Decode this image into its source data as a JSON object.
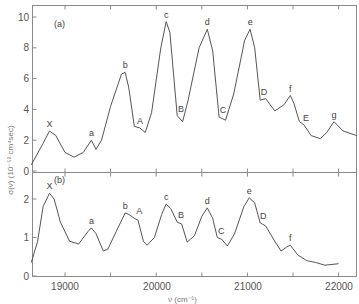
{
  "chart_data": [
    {
      "type": "line",
      "panel_label": "(a)",
      "xlabel": "ν (cm⁻¹)",
      "ylabel": "σ(ν) (10⁻⁵² cm⁴sec)",
      "xlim": [
        18630,
        22250
      ],
      "ylim": [
        0,
        11
      ],
      "yticks": [
        0,
        2,
        4,
        6,
        8,
        10
      ],
      "x": [
        18630,
        18760,
        18830,
        18900,
        19000,
        19100,
        19200,
        19290,
        19340,
        19400,
        19500,
        19620,
        19660,
        19700,
        19760,
        19820,
        19880,
        19950,
        20050,
        20110,
        20150,
        20230,
        20290,
        20350,
        20470,
        20560,
        20620,
        20690,
        20760,
        20850,
        20970,
        21030,
        21080,
        21140,
        21200,
        21300,
        21400,
        21470,
        21510,
        21570,
        21620,
        21700,
        21800,
        21870,
        21950,
        22050,
        22200
      ],
      "y": [
        0.4,
        1.8,
        2.6,
        2.3,
        1.2,
        0.9,
        1.2,
        2.0,
        1.4,
        2.0,
        4.2,
        6.3,
        6.4,
        5.4,
        2.9,
        2.8,
        2.5,
        3.8,
        8.0,
        9.7,
        9.0,
        3.6,
        3.2,
        4.6,
        8.0,
        9.2,
        7.8,
        3.5,
        3.3,
        5.0,
        8.5,
        9.2,
        8.0,
        4.6,
        4.7,
        3.9,
        4.3,
        4.9,
        4.4,
        3.2,
        3.0,
        2.3,
        2.1,
        2.5,
        3.2,
        2.6,
        2.3
      ],
      "peak_labels": [
        {
          "text": "X",
          "x": 18830,
          "y": 2.6
        },
        {
          "text": "a",
          "x": 19290,
          "y": 2.0
        },
        {
          "text": "b",
          "x": 19660,
          "y": 6.4
        },
        {
          "text": "A",
          "x": 19790,
          "y": 2.8
        },
        {
          "text": "c",
          "x": 20110,
          "y": 9.7
        },
        {
          "text": "B",
          "x": 20240,
          "y": 3.6
        },
        {
          "text": "d",
          "x": 20560,
          "y": 9.2
        },
        {
          "text": "C",
          "x": 20700,
          "y": 3.5
        },
        {
          "text": "e",
          "x": 21030,
          "y": 9.2
        },
        {
          "text": "D",
          "x": 21150,
          "y": 4.7
        },
        {
          "text": "f",
          "x": 21470,
          "y": 4.9
        },
        {
          "text": "E",
          "x": 21610,
          "y": 3.0
        },
        {
          "text": "g",
          "x": 21950,
          "y": 3.2
        }
      ]
    },
    {
      "type": "line",
      "panel_label": "(b)",
      "xlabel": "ν (cm⁻¹)",
      "ylabel": "σ(ν) (10⁻⁵² cm⁴sec)",
      "xlim": [
        18630,
        22250
      ],
      "ylim": [
        0,
        2.5
      ],
      "yticks": [
        0,
        1,
        2
      ],
      "xticks": [
        19000,
        20000,
        21000,
        22000
      ],
      "x": [
        18630,
        18700,
        18760,
        18830,
        18880,
        18950,
        19050,
        19150,
        19250,
        19290,
        19340,
        19420,
        19470,
        19560,
        19660,
        19700,
        19760,
        19800,
        19860,
        19900,
        19980,
        20060,
        20110,
        20160,
        20230,
        20280,
        20340,
        20420,
        20500,
        20560,
        20620,
        20670,
        20720,
        20780,
        20860,
        20960,
        21020,
        21080,
        21140,
        21200,
        21300,
        21370,
        21430,
        21470,
        21550,
        21650,
        21750,
        21850,
        22000
      ],
      "y": [
        0.35,
        0.9,
        1.8,
        2.15,
        2.0,
        1.4,
        0.9,
        0.83,
        1.15,
        1.25,
        1.1,
        0.65,
        0.7,
        1.15,
        1.64,
        1.6,
        1.5,
        1.45,
        0.9,
        0.8,
        1.0,
        1.6,
        1.87,
        1.75,
        1.4,
        1.35,
        0.88,
        1.05,
        1.55,
        1.77,
        1.5,
        1.0,
        0.95,
        0.78,
        1.1,
        1.8,
        2.03,
        1.9,
        1.38,
        1.3,
        0.9,
        0.65,
        0.75,
        0.8,
        0.55,
        0.4,
        0.35,
        0.28,
        0.32
      ],
      "peak_labels": [
        {
          "text": "X",
          "x": 18830,
          "y": 2.15
        },
        {
          "text": "a",
          "x": 19290,
          "y": 1.25
        },
        {
          "text": "b",
          "x": 19660,
          "y": 1.64
        },
        {
          "text": "A",
          "x": 19780,
          "y": 1.5
        },
        {
          "text": "c",
          "x": 20110,
          "y": 1.87
        },
        {
          "text": "B",
          "x": 20240,
          "y": 1.4
        },
        {
          "text": "d",
          "x": 20560,
          "y": 1.77
        },
        {
          "text": "C",
          "x": 20680,
          "y": 1.0
        },
        {
          "text": "e",
          "x": 21020,
          "y": 2.03
        },
        {
          "text": "D",
          "x": 21140,
          "y": 1.38
        },
        {
          "text": "f",
          "x": 21470,
          "y": 0.8
        }
      ]
    }
  ],
  "labels": {
    "panel_a": "(a)",
    "panel_b": "(b)",
    "xlabel": "ν (cm⁻¹)",
    "ylabel": "σ(ν) (10⁻⁵² cm⁴sec)",
    "xtick_19000": "19000",
    "xtick_20000": "20000",
    "xtick_21000": "21000",
    "xtick_22000": "22000"
  }
}
